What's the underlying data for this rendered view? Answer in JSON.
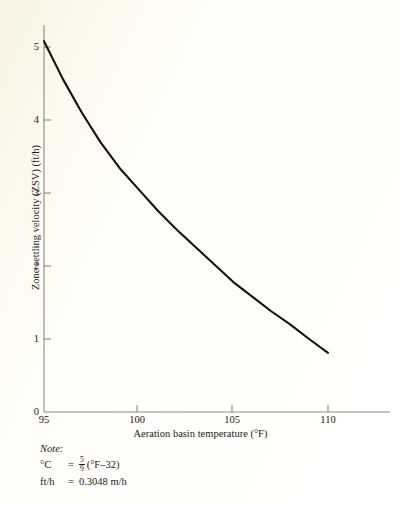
{
  "figure": {
    "background_color": "#fffef8",
    "curve_color": "#111111",
    "axis_color": "#8a8a85"
  },
  "axes": {
    "x_title": "Aeration basin temperature (°F)",
    "y_title": "Zone settling velocity (ZSV) (ft/h)",
    "x_ticks": [
      "95",
      "100",
      "105",
      "110"
    ],
    "y_ticks": [
      "0",
      "1",
      "2",
      "3",
      "4",
      "5"
    ]
  },
  "note": {
    "heading": "Note:",
    "line1_lhs": "°C",
    "line1_eq": "=",
    "line1_num": "5",
    "line1_den": "9",
    "line1_rhs": "(°F–32)",
    "line2_lhs": "ft/h",
    "line2_eq": "=",
    "line2_rhs": "0.3048 m/h"
  },
  "chart_data": {
    "type": "line",
    "title": "",
    "xlabel": "Aeration basin temperature (°F)",
    "ylabel": "Zone settling velocity (ZSV) (ft/h)",
    "xlim": [
      95,
      111.5
    ],
    "ylim": [
      0,
      5.4
    ],
    "xticks": [
      95,
      100,
      105,
      110
    ],
    "yticks": [
      0,
      1,
      2,
      3,
      4,
      5
    ],
    "grid": false,
    "legend": null,
    "series": [
      {
        "name": "Zone settling velocity",
        "x": [
          95,
          96,
          97,
          98,
          99,
          100,
          101,
          102,
          103,
          104,
          105,
          106,
          107,
          108,
          109,
          110
        ],
        "values": [
          5.08,
          4.56,
          4.1,
          3.69,
          3.34,
          3.05,
          2.76,
          2.5,
          2.26,
          2.02,
          1.78,
          1.58,
          1.38,
          1.2,
          1.0,
          0.81
        ]
      }
    ]
  }
}
